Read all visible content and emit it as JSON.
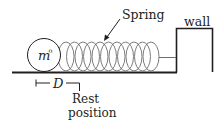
{
  "diagram": {
    "mass_label": "m",
    "mass_superscript": "o",
    "spring_label": "Spring",
    "wall_label": "wall",
    "displacement_label": "D",
    "rest_label_line1": "Rest",
    "rest_label_line2": "position",
    "stroke_color": "#231f20",
    "spring_color": "#6d6e71",
    "coil_count": 11
  }
}
